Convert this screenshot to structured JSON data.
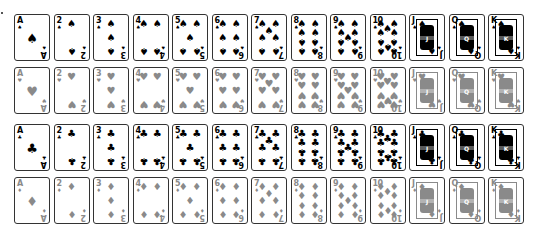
{
  "layout": {
    "col_x": [
      14,
      53.5,
      93,
      132.5,
      172,
      211.5,
      251,
      290.5,
      330,
      369.5,
      409,
      448.5,
      488
    ],
    "row_y": [
      14,
      67,
      124,
      177
    ]
  },
  "colors": {
    "black": "#000000",
    "gray": "#8a8a8a",
    "border": "#333333",
    "background": "#ffffff"
  },
  "ranks": [
    "A",
    "2",
    "3",
    "4",
    "5",
    "6",
    "7",
    "8",
    "9",
    "10",
    "J",
    "Q",
    "K"
  ],
  "rows": [
    {
      "suit": "spades",
      "symbol": "♠",
      "tone": "black"
    },
    {
      "suit": "hearts",
      "symbol": "♥",
      "tone": "gray"
    },
    {
      "suit": "clubs",
      "symbol": "♣",
      "tone": "black"
    },
    {
      "suit": "diamonds",
      "symbol": "♦",
      "tone": "gray"
    }
  ],
  "pip_layouts": {
    "A": [
      [
        50,
        50,
        0
      ]
    ],
    "2": [
      [
        50,
        20,
        0
      ],
      [
        50,
        80,
        1
      ]
    ],
    "3": [
      [
        50,
        20,
        0
      ],
      [
        50,
        50,
        0
      ],
      [
        50,
        80,
        1
      ]
    ],
    "4": [
      [
        30,
        20,
        0
      ],
      [
        70,
        20,
        0
      ],
      [
        30,
        80,
        1
      ],
      [
        70,
        80,
        1
      ]
    ],
    "5": [
      [
        30,
        20,
        0
      ],
      [
        70,
        20,
        0
      ],
      [
        50,
        50,
        0
      ],
      [
        30,
        80,
        1
      ],
      [
        70,
        80,
        1
      ]
    ],
    "6": [
      [
        30,
        20,
        0
      ],
      [
        70,
        20,
        0
      ],
      [
        30,
        50,
        0
      ],
      [
        70,
        50,
        0
      ],
      [
        30,
        80,
        1
      ],
      [
        70,
        80,
        1
      ]
    ],
    "7": [
      [
        30,
        20,
        0
      ],
      [
        70,
        20,
        0
      ],
      [
        50,
        35,
        0
      ],
      [
        30,
        50,
        0
      ],
      [
        70,
        50,
        0
      ],
      [
        30,
        80,
        1
      ],
      [
        70,
        80,
        1
      ]
    ],
    "8": [
      [
        30,
        20,
        0
      ],
      [
        70,
        20,
        0
      ],
      [
        30,
        40,
        0
      ],
      [
        70,
        40,
        0
      ],
      [
        30,
        60,
        1
      ],
      [
        70,
        60,
        1
      ],
      [
        30,
        80,
        1
      ],
      [
        70,
        80,
        1
      ]
    ],
    "9": [
      [
        30,
        20,
        0
      ],
      [
        70,
        20,
        0
      ],
      [
        30,
        40,
        0
      ],
      [
        70,
        40,
        0
      ],
      [
        50,
        50,
        0
      ],
      [
        30,
        60,
        1
      ],
      [
        70,
        60,
        1
      ],
      [
        30,
        80,
        1
      ],
      [
        70,
        80,
        1
      ]
    ],
    "10": [
      [
        30,
        20,
        0
      ],
      [
        70,
        20,
        0
      ],
      [
        50,
        30,
        0
      ],
      [
        30,
        40,
        0
      ],
      [
        70,
        40,
        0
      ],
      [
        30,
        60,
        1
      ],
      [
        70,
        60,
        1
      ],
      [
        50,
        70,
        1
      ],
      [
        30,
        80,
        1
      ],
      [
        70,
        80,
        1
      ]
    ]
  }
}
